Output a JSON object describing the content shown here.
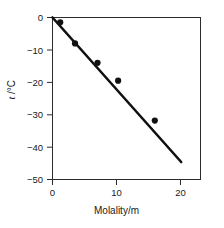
{
  "chart_data": {
    "type": "scatter",
    "title": "",
    "xlabel": "Molality/m",
    "ylabel": "t/°C",
    "ylabel_variable": "t",
    "ylabel_unit": "/°C",
    "xlim": [
      0,
      23
    ],
    "ylim": [
      -50,
      0
    ],
    "grid": false,
    "legend": null,
    "xticks": [
      0,
      10,
      20
    ],
    "xtick_labels": [
      "0",
      "10",
      "20"
    ],
    "yticks": [
      0,
      -10,
      -20,
      -30,
      -40,
      -50
    ],
    "ytick_labels": [
      "0",
      "−10",
      "−20",
      "−30",
      "−40",
      "−50"
    ],
    "series": [
      {
        "name": "freezing point data",
        "type": "scatter",
        "marker": "filled-circle",
        "color": "#111111",
        "points": [
          {
            "x": 1.2,
            "y": -1.5
          },
          {
            "x": 3.5,
            "y": -8.0
          },
          {
            "x": 7.0,
            "y": -14.0
          },
          {
            "x": 10.2,
            "y": -19.5
          },
          {
            "x": 15.9,
            "y": -31.8
          }
        ]
      },
      {
        "name": "linear fit",
        "type": "line",
        "color": "#111111",
        "points": [
          {
            "x": 0.0,
            "y": 0.0
          },
          {
            "x": 20.0,
            "y": -44.6
          }
        ]
      }
    ]
  },
  "axes": {
    "x_title": "Molality/m",
    "y_title_variable": "t",
    "y_title_unit": "/°C"
  },
  "colors": {
    "frame": "#2b2b2b",
    "data": "#111111",
    "background": "#ffffff"
  }
}
